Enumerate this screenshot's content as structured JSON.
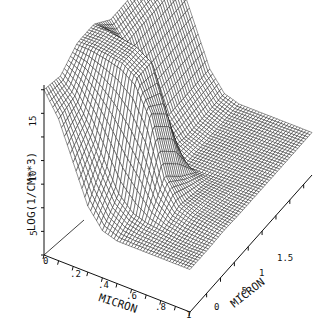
{
  "chart_data": {
    "type": "surface3d",
    "title": "",
    "zlabel": "LOG(1/CM**3)",
    "xlabel": "MICRON",
    "ylabel": "MICRON",
    "z_ticks": [
      "0",
      "5",
      "10",
      "15"
    ],
    "z_range": [
      0,
      18
    ],
    "x_ticks": [
      "0",
      ".2",
      ".4",
      ".6",
      ".8",
      "1"
    ],
    "x_range": [
      0,
      1
    ],
    "y_ticks": [
      "0",
      ".5",
      "1",
      "1.5"
    ],
    "y_range": [
      -0.3,
      1.9
    ],
    "grid": false,
    "surface_samples": {
      "x": [
        0,
        0.1,
        0.2,
        0.3,
        0.4,
        0.5,
        0.6,
        0.7,
        0.8,
        0.9,
        1.0
      ],
      "y": [
        -0.3,
        0.0,
        0.3,
        0.6,
        0.9,
        1.2,
        1.5,
        1.8
      ],
      "z": [
        [
          17.5,
          17.0,
          18.5,
          18.5,
          17.0,
          17.0,
          17.0,
          17.0
        ],
        [
          15.0,
          15.5,
          18.5,
          18.5,
          15.0,
          15.0,
          15.0,
          15.0
        ],
        [
          11.0,
          13.0,
          18.3,
          18.3,
          11.0,
          11.0,
          11.0,
          11.0
        ],
        [
          7.0,
          10.0,
          18.0,
          18.0,
          7.0,
          7.0,
          7.0,
          7.0
        ],
        [
          5.0,
          7.0,
          17.0,
          17.0,
          5.5,
          5.0,
          5.0,
          5.0
        ],
        [
          4.5,
          5.5,
          14.0,
          12.0,
          4.5,
          4.5,
          4.5,
          4.5
        ],
        [
          4.5,
          5.0,
          8.0,
          6.0,
          4.5,
          4.5,
          4.5,
          4.5
        ],
        [
          4.5,
          4.8,
          5.5,
          5.0,
          4.5,
          4.5,
          4.5,
          4.5
        ],
        [
          4.5,
          4.6,
          5.0,
          4.8,
          4.5,
          4.5,
          4.5,
          4.5
        ],
        [
          4.5,
          4.5,
          4.8,
          4.6,
          4.5,
          4.5,
          4.5,
          4.5
        ],
        [
          4.5,
          4.5,
          4.6,
          4.5,
          4.5,
          4.5,
          4.5,
          4.5
        ]
      ]
    }
  },
  "labels": {
    "zlabel": "LOG(1/CM**3)",
    "xlabel": "MICRON",
    "ylabel": "MICRON",
    "z_ticks": [
      "5",
      "10",
      "15"
    ],
    "x_ticks": [
      "0",
      ".2",
      ".4",
      ".6",
      ".8",
      "1"
    ],
    "y_ticks": [
      "0",
      ".5",
      "1",
      "1.5"
    ]
  }
}
